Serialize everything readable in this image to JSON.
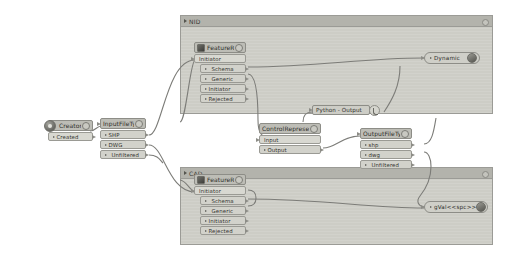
{
  "app": {
    "canvas_background": "#ffffff",
    "node_fill": "#cfcfc8",
    "group_fill": "#cdcdc6",
    "wire_color": "#7c7c78"
  },
  "groups": [
    {
      "name": "nid",
      "title": "NID"
    },
    {
      "name": "cad",
      "title": "CAD"
    }
  ],
  "nodes": {
    "creator": {
      "title": "Creator",
      "ports": [
        {
          "label": "Created"
        }
      ]
    },
    "input_file_type": {
      "title": "InputFileType",
      "ports": [
        {
          "label": "SHP"
        },
        {
          "label": "DWG"
        },
        {
          "label": "Unfiltered"
        }
      ]
    },
    "nid_feature_reader": {
      "title": "FeatureReader",
      "ports": [
        {
          "label": "Initiator"
        },
        {
          "label": "Schema"
        },
        {
          "label": "Generic"
        },
        {
          "label": "Initiator"
        },
        {
          "label": "Rejected"
        }
      ]
    },
    "cad_feature_reader": {
      "title": "FeatureReader_2",
      "ports": [
        {
          "label": "Initiator"
        },
        {
          "label": "Schema"
        },
        {
          "label": "Generic"
        },
        {
          "label": "Initiator"
        },
        {
          "label": "Rejected"
        }
      ]
    },
    "control_representor": {
      "title": "ControlRepresentor",
      "ports": [
        {
          "label": "Input"
        },
        {
          "label": "Output"
        }
      ]
    },
    "output_file_type": {
      "title": "OutputFileType",
      "ports": [
        {
          "label": "shp"
        },
        {
          "label": "dwg"
        },
        {
          "label": "Unfiltered"
        }
      ]
    },
    "python_output": {
      "title": "Python - Output"
    },
    "dynamic_writer": {
      "title": "Dynamic"
    },
    "var_writer": {
      "title": "gVal<<spc>>"
    }
  }
}
